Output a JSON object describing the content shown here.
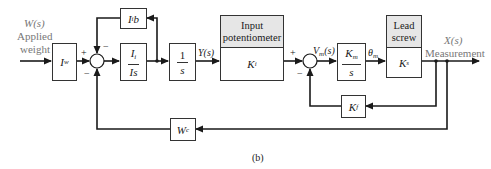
{
  "diagram": {
    "type": "block-diagram",
    "caption": "(b)",
    "input": {
      "signal": "W(s)",
      "label_line1": "Applied",
      "label_line2": "weight"
    },
    "output": {
      "signal": "X(s)",
      "label": "Measurement"
    },
    "blocks": {
      "iw": {
        "symbol": "I",
        "sub": "w"
      },
      "iib": {
        "symbol": "I",
        "sub": "i",
        "suffix": "b"
      },
      "ii_is": {
        "num_symbol": "I",
        "num_sub": "i",
        "den": "Is"
      },
      "integrator": {
        "num": "1",
        "den": "s"
      },
      "input_pot": {
        "header_line1": "Input",
        "header_line2": "potentiometer",
        "symbol": "K",
        "sub": "i"
      },
      "motor": {
        "num_symbol": "K",
        "num_sub": "m",
        "den": "s"
      },
      "lead_screw": {
        "header_line1": "Lead",
        "header_line2": "screw",
        "symbol": "K",
        "sub": "s"
      },
      "kf": {
        "symbol": "K",
        "sub": "f"
      },
      "wc": {
        "symbol": "W",
        "sub": "c"
      }
    },
    "signals": {
      "y": "Y(s)",
      "vm_symbol": "V",
      "vm_sub": "m",
      "vm_arg": "(s)",
      "theta_symbol": "θ",
      "theta_sub": "m"
    },
    "summing_junctions": {
      "sum1": {
        "plus": "+",
        "minus_top": "−",
        "minus_bottom": "−"
      },
      "sum2": {
        "plus": "+",
        "minus_bottom": "−"
      }
    },
    "colors": {
      "line": "#1a1a1a",
      "header_fill": "#e6e6e6",
      "label_gray": "#777777"
    }
  }
}
